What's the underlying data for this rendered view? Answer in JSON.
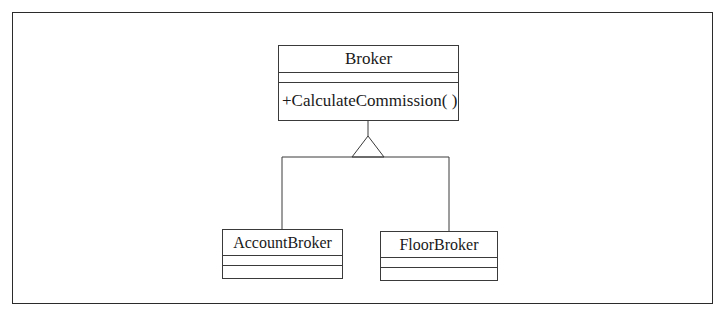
{
  "diagram": {
    "type": "uml-class-diagram",
    "relationship": "generalization",
    "classes": [
      {
        "id": "broker",
        "name": "Broker",
        "attributes": [],
        "operations": [
          "+CalculateCommission( )"
        ]
      },
      {
        "id": "account-broker",
        "name": "AccountBroker",
        "attributes": [],
        "operations": []
      },
      {
        "id": "floor-broker",
        "name": "FloorBroker",
        "attributes": [],
        "operations": []
      }
    ],
    "edges": [
      {
        "from": "AccountBroker",
        "to": "Broker",
        "type": "inheritance"
      },
      {
        "from": "FloorBroker",
        "to": "Broker",
        "type": "inheritance"
      }
    ]
  }
}
